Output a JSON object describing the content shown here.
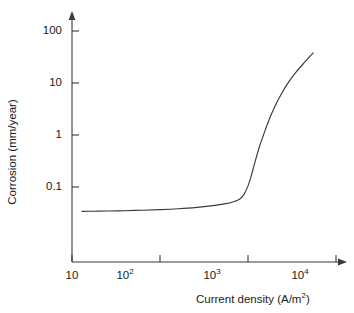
{
  "chart_data": {
    "type": "line",
    "title": "",
    "xlabel": "Current density (A/m²)",
    "ylabel": "Corrosion (mm/year)",
    "xscale": "log",
    "yscale": "log",
    "xlim": [
      10,
      16000
    ],
    "ylim": [
      0.02,
      200
    ],
    "grid": false,
    "legend": null,
    "xticks": [
      {
        "value": 10,
        "mantissa": "10",
        "exponent": ""
      },
      {
        "value": 100,
        "mantissa": "10",
        "exponent": "2"
      },
      {
        "value": 1000,
        "mantissa": "10",
        "exponent": "3"
      },
      {
        "value": 10000,
        "mantissa": "10",
        "exponent": "4"
      }
    ],
    "yticks": [
      {
        "value": 100,
        "label": "100"
      },
      {
        "value": 10,
        "label": "10"
      },
      {
        "value": 1,
        "label": "1"
      },
      {
        "value": 0.1,
        "label": "0.1"
      }
    ],
    "series": [
      {
        "name": "corrosion rate",
        "x": [
          13,
          18,
          25,
          40,
          63,
          100,
          160,
          250,
          400,
          560,
          700,
          800,
          900,
          1000,
          1100,
          1200,
          1350,
          1500,
          1700,
          2000,
          2400,
          2900,
          3500,
          4300,
          5500
        ],
        "y": [
          0.034,
          0.0342,
          0.0345,
          0.035,
          0.0358,
          0.0368,
          0.0382,
          0.0402,
          0.0438,
          0.0478,
          0.0525,
          0.058,
          0.072,
          0.105,
          0.175,
          0.3,
          0.6,
          1.0,
          1.8,
          3.4,
          6.2,
          10.5,
          16.0,
          24.0,
          38.0
        ]
      }
    ]
  },
  "axes": {
    "x_arrow": "right-arrow",
    "y_arrow": "up-arrow",
    "line_color": "#3a3a3a",
    "curve_color": "#3a3a3a"
  }
}
